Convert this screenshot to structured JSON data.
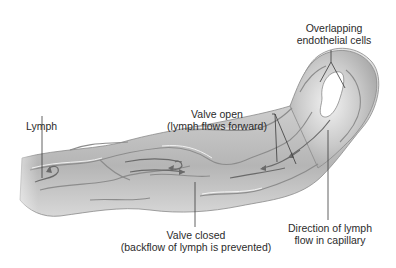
{
  "diagram": {
    "labels": {
      "overlapping_cells": {
        "line1": "Overlapping",
        "line2": "endothelial cells"
      },
      "valve_open": {
        "line1": "Valve open",
        "line2": "(lymph flows forward)"
      },
      "lymph": {
        "text": "Lymph"
      },
      "valve_closed": {
        "line1": "Valve closed",
        "line2": "(backflow of lymph is prevented)"
      },
      "direction": {
        "line1": "Direction of lymph",
        "line2": "flow in capillary"
      }
    },
    "colors": {
      "vessel_fill": "#cfcfcf",
      "vessel_shadow": "#9a9a9a",
      "vessel_highlight": "#ececec",
      "leader_line": "#3a3a3a",
      "arrow": "#6a6a6a"
    }
  }
}
